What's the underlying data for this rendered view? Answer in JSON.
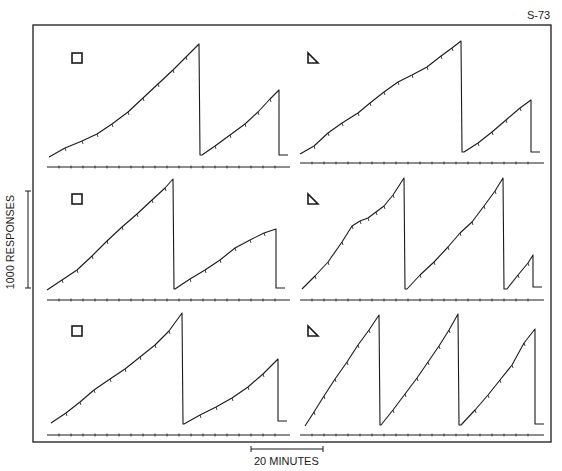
{
  "figure": {
    "id_label": "S-73",
    "y_scale_label": "1000 RESPONSES",
    "x_scale_label": "20 MINUTES",
    "stroke_color": "#1a1a1a",
    "background": "#ffffff"
  },
  "chart_data": {
    "type": "line",
    "title": "S-73",
    "xlabel": "Time (scale bar: 20 MINUTES)",
    "ylabel": "Cumulative responses (scale bar: 1000 RESPONSES)",
    "grid": false,
    "legend": "none; each panel marked with stimulus symbol",
    "panels": [
      {
        "row": 1,
        "col": 1,
        "symbol": "square",
        "segments_px": [
          [
            [
              49,
              157
            ],
            [
              65,
              148
            ],
            [
              82,
              141
            ],
            [
              97,
              134
            ],
            [
              112,
              124
            ],
            [
              128,
              112
            ],
            [
              143,
              98
            ],
            [
              158,
              84
            ],
            [
              173,
              70
            ],
            [
              186,
              57
            ],
            [
              199,
              44
            ]
          ],
          [
            [
              202,
              155
            ],
            [
              215,
              146
            ],
            [
              230,
              135
            ],
            [
              245,
              124
            ],
            [
              258,
              112
            ],
            [
              270,
              99
            ],
            [
              279,
              90
            ]
          ]
        ],
        "pen_resets": 1,
        "event_line_y": 167
      },
      {
        "row": 1,
        "col": 2,
        "symbol": "triangle",
        "segments_px": [
          [
            [
              300,
              154
            ],
            [
              314,
              146
            ],
            [
              328,
              133
            ],
            [
              342,
              123
            ],
            [
              358,
              113
            ],
            [
              370,
              103
            ],
            [
              384,
              92
            ],
            [
              398,
              82
            ],
            [
              412,
              75
            ],
            [
              427,
              67
            ],
            [
              441,
              56
            ],
            [
              452,
              48
            ],
            [
              461,
              41
            ]
          ],
          [
            [
              464,
              152
            ],
            [
              478,
              143
            ],
            [
              492,
              132
            ],
            [
              506,
              120
            ],
            [
              520,
              108
            ],
            [
              531,
              100
            ]
          ]
        ],
        "pen_resets": 1,
        "event_line_y": 163
      },
      {
        "row": 2,
        "col": 1,
        "symbol": "square",
        "segments_px": [
          [
            [
              47,
              290
            ],
            [
              62,
              280
            ],
            [
              77,
              270
            ],
            [
              92,
              256
            ],
            [
              107,
              241
            ],
            [
              122,
              227
            ],
            [
              137,
              214
            ],
            [
              152,
              200
            ],
            [
              165,
              188
            ],
            [
              173,
              179
            ]
          ],
          [
            [
              175,
              289
            ],
            [
              190,
              279
            ],
            [
              205,
              270
            ],
            [
              220,
              260
            ],
            [
              235,
              248
            ],
            [
              250,
              240
            ],
            [
              264,
              233
            ],
            [
              276,
              229
            ]
          ]
        ],
        "pen_resets": 1,
        "event_line_y": 300
      },
      {
        "row": 2,
        "col": 2,
        "symbol": "triangle",
        "segments_px": [
          [
            [
              302,
              289
            ],
            [
              315,
              276
            ],
            [
              328,
              262
            ],
            [
              342,
              242
            ],
            [
              352,
              226
            ],
            [
              360,
              221
            ],
            [
              368,
              218
            ],
            [
              376,
              212
            ],
            [
              384,
              206
            ],
            [
              393,
              195
            ],
            [
              404,
              178
            ]
          ],
          [
            [
              407,
              289
            ],
            [
              420,
              275
            ],
            [
              434,
              262
            ],
            [
              448,
              247
            ],
            [
              460,
              233
            ],
            [
              472,
              222
            ],
            [
              484,
              206
            ],
            [
              495,
              191
            ],
            [
              503,
              178
            ]
          ],
          [
            [
              507,
              289
            ],
            [
              518,
              275
            ],
            [
              528,
              263
            ],
            [
              533,
              255
            ]
          ]
        ],
        "pen_resets": 2,
        "event_line_y": 300
      },
      {
        "row": 3,
        "col": 1,
        "symbol": "square",
        "segments_px": [
          [
            [
              51,
              423
            ],
            [
              66,
              413
            ],
            [
              80,
              402
            ],
            [
              94,
              390
            ],
            [
              110,
              379
            ],
            [
              125,
              369
            ],
            [
              140,
              357
            ],
            [
              155,
              345
            ],
            [
              169,
              331
            ],
            [
              182,
              313
            ]
          ],
          [
            [
              184,
              424
            ],
            [
              200,
              415
            ],
            [
              216,
              407
            ],
            [
              232,
              398
            ],
            [
              248,
              387
            ],
            [
              263,
              374
            ],
            [
              278,
              359
            ]
          ]
        ],
        "pen_resets": 1,
        "event_line_y": 435
      },
      {
        "row": 3,
        "col": 2,
        "symbol": "triangle",
        "segments_px": [
          [
            [
              305,
              426
            ],
            [
              314,
              412
            ],
            [
              324,
              396
            ],
            [
              335,
              379
            ],
            [
              347,
              362
            ],
            [
              358,
              345
            ],
            [
              369,
              330
            ],
            [
              379,
              315
            ]
          ],
          [
            [
              381,
              425
            ],
            [
              393,
              410
            ],
            [
              405,
              394
            ],
            [
              417,
              378
            ],
            [
              428,
              362
            ],
            [
              439,
              346
            ],
            [
              449,
              330
            ],
            [
              458,
              314
            ]
          ],
          [
            [
              461,
              425
            ],
            [
              475,
              410
            ],
            [
              488,
              395
            ],
            [
              500,
              380
            ],
            [
              512,
              365
            ],
            [
              524,
              343
            ],
            [
              535,
              329
            ]
          ]
        ],
        "pen_resets": 2,
        "event_line_y": 435
      }
    ]
  },
  "panels": [
    {
      "symbol_name": "square"
    },
    {
      "symbol_name": "triangle"
    },
    {
      "symbol_name": "square"
    },
    {
      "symbol_name": "triangle"
    },
    {
      "symbol_name": "square"
    },
    {
      "symbol_name": "triangle"
    }
  ]
}
